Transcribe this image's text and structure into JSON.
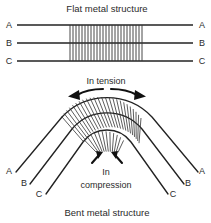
{
  "figure": {
    "name": "flat-vs-bent-metal-structure-diagram",
    "top_caption": "Flat metal structure",
    "bottom_caption": "Bent metal structure",
    "annotations": {
      "tension": "In tension",
      "compression_line1": "In",
      "compression_line2": "compression"
    },
    "layer_labels": [
      "A",
      "B",
      "C"
    ],
    "flat": {
      "left_labels": [
        "A",
        "B",
        "C"
      ],
      "right_labels": [
        "A",
        "B",
        "C"
      ],
      "hatch_count": 25
    },
    "bent": {
      "left_labels": [
        "A",
        "B",
        "C"
      ],
      "right_labels": [
        "A",
        "B",
        "C"
      ],
      "fan_count": 23
    },
    "colors": {
      "ink": "#222222",
      "hatch": "#333333",
      "arrow": "#111111",
      "background": "#ffffff"
    }
  }
}
